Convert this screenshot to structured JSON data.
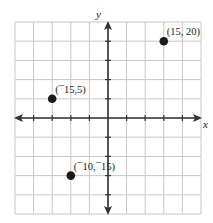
{
  "chart_data": {
    "type": "scatter",
    "title": "",
    "xlabel": "x",
    "ylabel": "y",
    "xlim": [
      -25,
      25
    ],
    "ylim": [
      -25,
      25
    ],
    "grid": true,
    "grid_step": 5,
    "points": [
      {
        "x": 15,
        "y": 20,
        "label": "(15, 20)"
      },
      {
        "x": -15,
        "y": 5,
        "label": "(¯15,5)"
      },
      {
        "x": -10,
        "y": -15,
        "label": "(¯10,¯15)"
      }
    ]
  },
  "colors": {
    "grid": "#c8c8c8",
    "axis": "#333333",
    "point": "#1a1a1a"
  }
}
